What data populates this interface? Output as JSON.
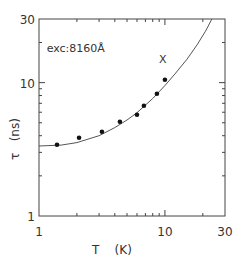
{
  "chart_data": {
    "type": "scatter",
    "title": "",
    "xlabel": "T    (K)",
    "ylabel": "τ   (ns)",
    "xscale": "log",
    "yscale": "log",
    "xlim": [
      1,
      30
    ],
    "ylim": [
      1,
      30
    ],
    "x_tick_labels": [
      "1",
      "10",
      "30"
    ],
    "x_tick_values": [
      1,
      10,
      30
    ],
    "y_tick_labels": [
      "1",
      "10",
      "30"
    ],
    "y_tick_values": [
      1,
      10,
      30
    ],
    "grid": false,
    "annotations": [
      {
        "text": "exc:8160Å",
        "x": 1.15,
        "y": 17
      },
      {
        "text": "X",
        "x": 9.6,
        "y": 14
      }
    ],
    "series": [
      {
        "name": "measured",
        "kind": "points",
        "x": [
          1.39,
          2.08,
          3.16,
          4.39,
          6.0,
          6.81,
          8.64,
          10.0
        ],
        "y": [
          3.42,
          3.86,
          4.28,
          5.09,
          5.74,
          6.71,
          8.26,
          10.5
        ]
      },
      {
        "name": "fit",
        "kind": "line",
        "x": [
          1.0,
          1.5,
          2.0,
          3.0,
          4.0,
          5.0,
          6.0,
          8.0,
          10.0,
          12.0,
          15.0,
          18.0,
          21.0,
          23.6
        ],
        "y": [
          3.35,
          3.4,
          3.55,
          4.0,
          4.6,
          5.25,
          5.95,
          7.6,
          9.5,
          11.6,
          15.0,
          19.2,
          24.3,
          30.0
        ]
      }
    ]
  }
}
